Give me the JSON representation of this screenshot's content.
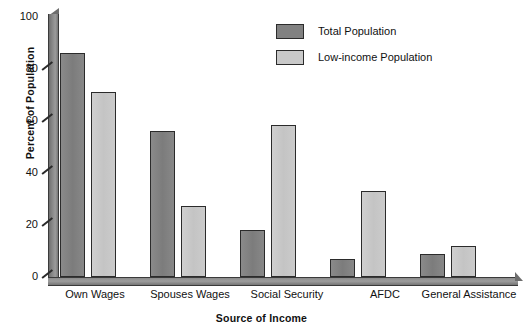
{
  "chart_data": {
    "type": "bar",
    "title": "",
    "xlabel": "Source of Income",
    "ylabel": "Percent of Population",
    "ylim": [
      0,
      100
    ],
    "yticks": [
      0,
      20,
      40,
      60,
      80,
      100
    ],
    "grid": false,
    "legend_position": "top-center",
    "categories": [
      "Own Wages",
      "Spouses Wages",
      "Social Security",
      "AFDC",
      "General Assistance"
    ],
    "series": [
      {
        "name": "Total Population",
        "color": "#818181",
        "values": [
          86,
          56,
          18,
          7,
          9
        ]
      },
      {
        "name": "Low-income Population",
        "color": "#c9c9c9",
        "values": [
          71,
          27.5,
          58.5,
          33,
          12
        ]
      }
    ]
  },
  "axes": {
    "y_title": "Percent of Population",
    "x_title": "Source of Income",
    "y_tick_labels": [
      "0",
      "20",
      "40",
      "60",
      "80",
      "100"
    ],
    "x_tick_labels": [
      "Own Wages",
      "Spouses Wages",
      "Social Security",
      "AFDC",
      "General Assistance"
    ]
  },
  "legend": {
    "items": [
      {
        "label": "Total Population",
        "swatch": "#818181"
      },
      {
        "label": "Low-income Population",
        "swatch": "#c9c9c9"
      }
    ]
  },
  "caption": ""
}
